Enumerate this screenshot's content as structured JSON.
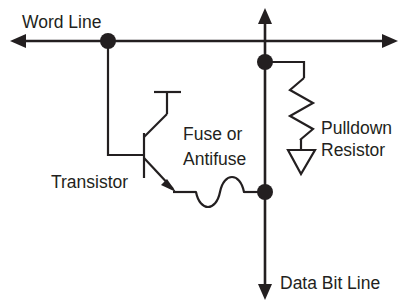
{
  "diagram": {
    "background_color": "#ffffff",
    "line_color": "#231f20",
    "labels": {
      "word_line": "Word Line",
      "transistor": "Transistor",
      "fuse_line1": "Fuse or",
      "fuse_line2": "Antifuse",
      "pulldown_line1": "Pulldown",
      "pulldown_line2": "Resistor",
      "data_bit_line": "Data Bit Line"
    },
    "components": [
      {
        "name": "word-line",
        "type": "bus-horizontal",
        "label": "Word Line",
        "orientation": "horizontal",
        "arrowheads": "both"
      },
      {
        "name": "data-bit-line",
        "type": "bus-vertical",
        "label": "Data Bit Line",
        "orientation": "vertical",
        "arrowheads": "both"
      },
      {
        "name": "transistor",
        "type": "bipolar-npn",
        "label": "Transistor"
      },
      {
        "name": "fuse-antifuse",
        "type": "squiggle-element",
        "label": "Fuse or Antifuse"
      },
      {
        "name": "pulldown-resistor",
        "type": "zigzag-resistor",
        "label": "Pulldown Resistor"
      },
      {
        "name": "ground",
        "type": "triangle-ground",
        "label": ""
      }
    ],
    "junction_dots": [
      {
        "name": "word-line-gate-junction",
        "x": 108,
        "y": 41
      },
      {
        "name": "bit-line-resistor-junction",
        "x": 265,
        "y": 62
      },
      {
        "name": "bit-line-fuse-junction",
        "x": 265,
        "y": 192
      }
    ]
  }
}
